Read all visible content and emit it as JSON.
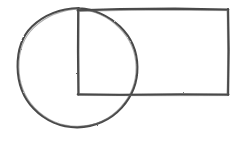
{
  "canvas": {
    "width": 237,
    "height": 146,
    "background_color": "#ffffff",
    "description": "Hand-drawn geometric sketch: a circle overlapping a rectangle"
  },
  "style": {
    "ink_color": "#4a4a4a",
    "ink_color_light": "#6e6e6e",
    "stroke_width": 2.0,
    "texture": "pencil"
  },
  "shapes": {
    "circle": {
      "name": "circle",
      "center_x": 77.5,
      "center_y": 67.5,
      "radius": 60,
      "left_x": 17.5,
      "right_x": 137.5,
      "top_y": 7.5,
      "bottom_y": 127.5
    },
    "rectangle": {
      "name": "rectangle",
      "left_x": 78,
      "right_x": 228,
      "top_y": 9.5,
      "bottom_y": 94.5,
      "width": 150,
      "height": 85
    }
  },
  "labels": {
    "circle": "circle",
    "rectangle": "rectangle",
    "figure": "geometric-figure"
  }
}
